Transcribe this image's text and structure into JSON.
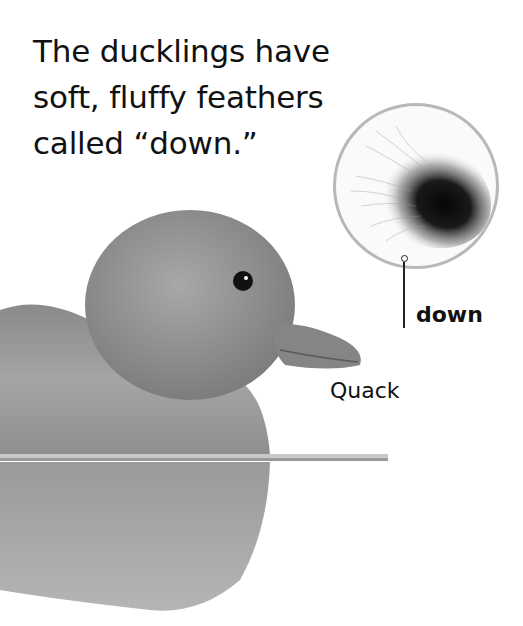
{
  "page": {
    "heading_lines": [
      "The ducklings have",
      "soft, fluffy feathers",
      "called “down.”"
    ],
    "labels": {
      "down": "down",
      "quack": "Quack"
    },
    "images": {
      "duckling": "duckling-photo",
      "inset": "down-feather-closeup"
    },
    "colors": {
      "background": "#ffffff",
      "text": "#111111",
      "inset_border": "#b8b8b8"
    }
  }
}
